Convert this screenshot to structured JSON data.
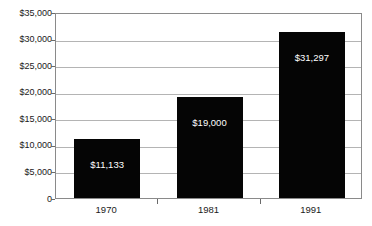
{
  "chart_data": {
    "type": "bar",
    "title": "",
    "subtitle": "",
    "xlabel": "",
    "ylabel": "",
    "categories": [
      "1970",
      "1981",
      "1991"
    ],
    "values": [
      11133,
      19000,
      31297
    ],
    "value_labels": [
      "$11,133",
      "$19,000",
      "$31,297"
    ],
    "ylim": [
      0,
      35000
    ],
    "y_ticks": [
      0,
      5000,
      10000,
      15000,
      20000,
      25000,
      30000,
      35000
    ],
    "y_tick_labels": [
      "0",
      "$5,000",
      "$10,000",
      "$15,000",
      "$20,000",
      "$25,000",
      "$30,000",
      "$35,000"
    ],
    "grid": true,
    "legend": false,
    "legend_position": "none",
    "series": [
      {
        "name": "",
        "values": [
          11133,
          19000,
          31297
        ],
        "color": "#050505"
      }
    ],
    "colors": {
      "bar": "#050505",
      "value_text": "#ffffff",
      "axis_text": "#1a1a1a",
      "frame": "#8a8a8a",
      "gridline": "#b4b4b4",
      "background": "#ffffff"
    }
  }
}
